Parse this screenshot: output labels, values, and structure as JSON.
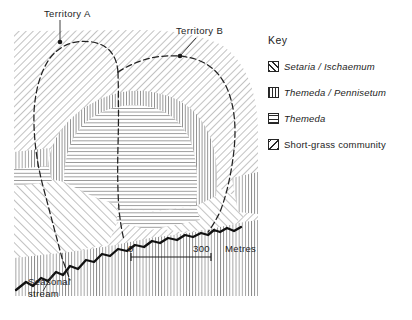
{
  "figure": {
    "type": "map"
  },
  "annotations": {
    "territory_a": "Territory A",
    "territory_b": "Territory B",
    "seasonal_stream": "Seasonal\nstream"
  },
  "scale_bar": {
    "start_label": "0",
    "end_label": "300",
    "unit_label": "Metres"
  },
  "key": {
    "title": "Key",
    "items": [
      {
        "label": "Setaria / Ischaemum",
        "pattern": "diagonal-forward",
        "italic": true
      },
      {
        "label": "Themeda / Pennisetum",
        "pattern": "vertical",
        "italic": true
      },
      {
        "label": "Themeda",
        "pattern": "horizontal",
        "italic": true
      },
      {
        "label": "Short-grass community",
        "pattern": "diagonal-backward",
        "italic": false
      }
    ]
  },
  "colors": {
    "ink": "#1d1d1d",
    "hatch": "#6e6e6e",
    "hatch_dark": "#2b2b2b",
    "stream": "#111111",
    "background": "#ffffff"
  },
  "map_regions": [
    {
      "name": "setaria-ischaemum-outer",
      "pattern": "diagonal-forward"
    },
    {
      "name": "themeda-pennisetum-band",
      "pattern": "vertical"
    },
    {
      "name": "themeda-core",
      "pattern": "horizontal"
    },
    {
      "name": "short-grass-lower",
      "pattern": "diagonal-backward"
    }
  ],
  "boundaries": [
    {
      "name": "territory-a-boundary",
      "style": "dashed"
    },
    {
      "name": "territory-b-boundary",
      "style": "dashed"
    }
  ]
}
